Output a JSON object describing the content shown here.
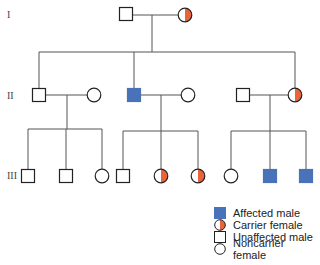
{
  "colors": {
    "affected": "#4a72b8",
    "carrier": "#e8643c",
    "line": "#555555",
    "stroke": "#222222"
  },
  "generations": [
    {
      "label": "I",
      "y": 15
    },
    {
      "label": "II",
      "y": 96
    },
    {
      "label": "III",
      "y": 176
    }
  ],
  "legend": {
    "items": [
      {
        "symbol": "affected-male",
        "label": "Affected male"
      },
      {
        "symbol": "carrier-female",
        "label": "Carrier female"
      },
      {
        "symbol": "unaffected-male",
        "label": "Unaffected male"
      },
      {
        "symbol": "noncarrier-female",
        "label": "Noncarrier female"
      }
    ]
  },
  "pedigree": {
    "generation_I": [
      {
        "id": "I-1",
        "sex": "male",
        "status": "unaffected",
        "x": 126,
        "y": 14
      },
      {
        "id": "I-2",
        "sex": "female",
        "status": "carrier",
        "x": 185,
        "y": 15
      }
    ],
    "generation_II": [
      {
        "id": "II-1",
        "sex": "male",
        "status": "unaffected",
        "x": 39,
        "y": 95
      },
      {
        "id": "II-2",
        "sex": "female",
        "status": "noncarrier",
        "x": 94,
        "y": 95
      },
      {
        "id": "II-3",
        "sex": "male",
        "status": "affected",
        "x": 134,
        "y": 95
      },
      {
        "id": "II-4",
        "sex": "female",
        "status": "noncarrier",
        "x": 188,
        "y": 95
      },
      {
        "id": "II-5",
        "sex": "male",
        "status": "unaffected",
        "x": 243,
        "y": 95
      },
      {
        "id": "II-6",
        "sex": "female",
        "status": "carrier",
        "x": 295,
        "y": 95
      }
    ],
    "generation_III": [
      {
        "id": "III-1",
        "sex": "male",
        "status": "unaffected",
        "x": 28,
        "y": 176
      },
      {
        "id": "III-2",
        "sex": "male",
        "status": "unaffected",
        "x": 66,
        "y": 176
      },
      {
        "id": "III-3",
        "sex": "female",
        "status": "noncarrier",
        "x": 102,
        "y": 176
      },
      {
        "id": "III-4",
        "sex": "male",
        "status": "unaffected",
        "x": 123,
        "y": 176
      },
      {
        "id": "III-5",
        "sex": "female",
        "status": "carrier",
        "x": 161,
        "y": 176
      },
      {
        "id": "III-6",
        "sex": "female",
        "status": "carrier",
        "x": 198,
        "y": 176
      },
      {
        "id": "III-7",
        "sex": "female",
        "status": "noncarrier",
        "x": 231,
        "y": 176
      },
      {
        "id": "III-8",
        "sex": "male",
        "status": "affected",
        "x": 270,
        "y": 176
      },
      {
        "id": "III-9",
        "sex": "male",
        "status": "affected",
        "x": 306,
        "y": 176
      }
    ]
  }
}
